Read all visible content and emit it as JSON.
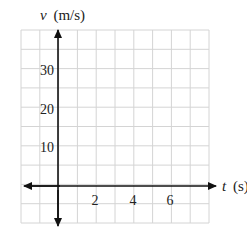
{
  "chart_data": {
    "type": "line",
    "title": "",
    "xlabel": "t (s)",
    "ylabel": "v (m/s)",
    "xlabel_var": "t",
    "xlabel_unit": "(s)",
    "ylabel_var": "v",
    "ylabel_unit": "(m/s)",
    "x_ticks": [
      "2",
      "4",
      "6"
    ],
    "y_ticks": [
      "10",
      "20",
      "30"
    ],
    "xlim": [
      -1,
      8
    ],
    "ylim": [
      -10,
      40
    ],
    "x_grid_step": 1,
    "y_grid_step": 5,
    "grid": true,
    "series": [],
    "legend": null,
    "note": "Empty velocity-time axes with grid; no data plotted"
  }
}
